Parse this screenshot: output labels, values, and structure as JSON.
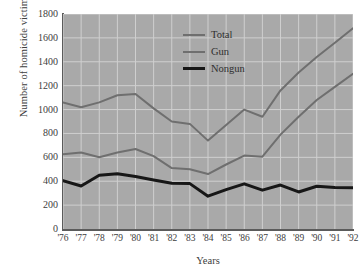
{
  "chart_data": {
    "type": "line",
    "title": "",
    "xlabel": "Years",
    "ylabel": "Number of homicide victims",
    "x": [
      "'76",
      "'77",
      "'78",
      "'79",
      "'80",
      "'81",
      "'82",
      "'83",
      "'84",
      "'85",
      "'86",
      "'87",
      "'88",
      "'89",
      "'90",
      "'91",
      "'92"
    ],
    "xlim": [
      0,
      16
    ],
    "ylim": [
      0,
      1800
    ],
    "yticks": [
      0,
      200,
      400,
      600,
      800,
      1000,
      1200,
      1400,
      1600,
      1800
    ],
    "ytick_labels": [
      "0",
      "200",
      "400",
      "600",
      "800",
      "1000",
      "1200",
      "1400",
      "1600",
      "1800"
    ],
    "grid": true,
    "grid_color": "#cfcfcf",
    "plot_background": "#a9a9a9",
    "legend_position": "top-center",
    "series": [
      {
        "name": "Total",
        "color": "#6f6f6f",
        "width": 2,
        "values": [
          1060,
          1020,
          1060,
          1120,
          1130,
          1010,
          900,
          880,
          740,
          870,
          1000,
          940,
          1160,
          1310,
          1440,
          1560,
          1680
        ]
      },
      {
        "name": "Gun",
        "color": "#6f6f6f",
        "width": 2,
        "values": [
          625,
          640,
          600,
          640,
          670,
          610,
          510,
          500,
          460,
          540,
          615,
          605,
          790,
          940,
          1080,
          1190,
          1300
        ]
      },
      {
        "name": "Nongun",
        "color": "#171717",
        "width": 3,
        "values": [
          405,
          360,
          450,
          462,
          440,
          410,
          383,
          380,
          275,
          330,
          378,
          325,
          368,
          310,
          358,
          348,
          345
        ]
      }
    ]
  }
}
